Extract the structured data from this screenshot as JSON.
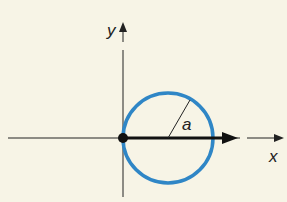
{
  "diagram": {
    "axes": {
      "x_label": "x",
      "y_label": "y"
    },
    "circle": {
      "radius_label": "a",
      "color": "#2f86c6"
    },
    "background": "#f7f4e6"
  }
}
